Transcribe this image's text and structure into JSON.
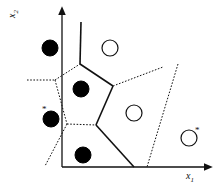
{
  "figure": {
    "background_color": "#ffffff",
    "line_color": "#111111",
    "width": 213,
    "height": 184
  },
  "axes": {
    "x_label": "x",
    "x_label_sub": "1",
    "y_label": "x",
    "y_label_sub": "2",
    "x_axis_name": "x-axis-arrow",
    "y_axis_name": "y-axis-arrow",
    "origin": [
      62,
      167
    ],
    "x_end": [
      205,
      167
    ],
    "y_end": [
      62,
      14
    ]
  },
  "chart_data": {
    "type": "scatter",
    "xlabel": "x1",
    "ylabel": "x2",
    "xlim": [
      0,
      213
    ],
    "ylim": [
      0,
      184
    ],
    "grid": false,
    "legend": "none",
    "series": [
      {
        "name": "class-filled",
        "marker": "filled-circle",
        "color": "#000000",
        "points": [
          {
            "id": "f1",
            "x": 50,
            "y": 48,
            "r": 8,
            "star": false
          },
          {
            "id": "f2",
            "x": 81,
            "y": 89,
            "r": 8,
            "star": false
          },
          {
            "id": "f3",
            "x": 51,
            "y": 119,
            "r": 8,
            "star": true,
            "star_dx": -9,
            "star_dy": -14
          },
          {
            "id": "f4",
            "x": 83,
            "y": 155,
            "r": 8,
            "star": false
          }
        ]
      },
      {
        "name": "class-open",
        "marker": "open-circle",
        "color": "#111111",
        "points": [
          {
            "id": "o1",
            "x": 110,
            "y": 48,
            "r": 8,
            "star": false
          },
          {
            "id": "o2",
            "x": 134,
            "y": 113,
            "r": 8,
            "star": false
          },
          {
            "id": "o3",
            "x": 189,
            "y": 138,
            "r": 8,
            "star": true,
            "star_dx": 6,
            "star_dy": -12
          }
        ]
      }
    ],
    "boundaries": {
      "solid_edges": [
        {
          "name": "top-vertical-edge",
          "points": [
            [
              81,
              22
            ],
            [
              80,
              64
            ]
          ]
        },
        {
          "name": "pentagon-upper-right-edge",
          "points": [
            [
              80,
              64
            ],
            [
              113,
              86
            ]
          ]
        },
        {
          "name": "pentagon-lower-right-edge",
          "points": [
            [
              113,
              86
            ],
            [
              96,
              125
            ]
          ]
        },
        {
          "name": "lower-right-descending-edge",
          "points": [
            [
              96,
              125
            ],
            [
              134,
              167
            ]
          ]
        }
      ],
      "dotted_edges": [
        {
          "name": "left-horizontal-edge",
          "points": [
            [
              27,
              80
            ],
            [
              55,
              80
            ]
          ]
        },
        {
          "name": "pentagon-upper-left-edge",
          "points": [
            [
              55,
              80
            ],
            [
              80,
              64
            ]
          ]
        },
        {
          "name": "pentagon-lower-left-edge",
          "points": [
            [
              55,
              80
            ],
            [
              67,
              124
            ]
          ]
        },
        {
          "name": "pentagon-bottom-edge",
          "points": [
            [
              67,
              124
            ],
            [
              96,
              125
            ]
          ]
        },
        {
          "name": "lower-left-descending-edge",
          "points": [
            [
              67,
              124
            ],
            [
              45,
              166
            ]
          ]
        },
        {
          "name": "upper-right-branch-edge",
          "points": [
            [
              113,
              86
            ],
            [
              163,
              67
            ]
          ]
        },
        {
          "name": "right-long-diagonal-edge",
          "points": [
            [
              178,
              64
            ],
            [
              147,
              167
            ]
          ]
        }
      ]
    }
  }
}
